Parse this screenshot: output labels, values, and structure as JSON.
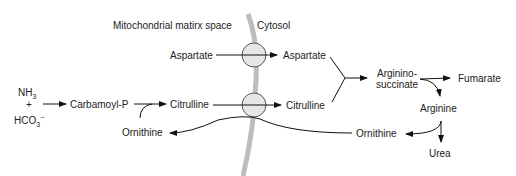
{
  "regions": {
    "matrix": "Mitochondrial matirx space",
    "cytosol": "Cytosol"
  },
  "nodes": {
    "nh3": "NH",
    "nh3_sub": "3",
    "plus": "+",
    "hco3": "HCO",
    "hco3_sub": "3",
    "hco3_sup": "−",
    "carbamoyl_p": "Carbamoyl-P",
    "citrulline_mito": "Citrulline",
    "ornithine_mito": "Ornithine",
    "aspartate_mito": "Aspartate",
    "aspartate_cyto": "Aspartate",
    "citrulline_cyto": "Citrulline",
    "argininosuccinate_1": "Arginino-",
    "argininosuccinate_2": "succinate",
    "fumarate": "Fumarate",
    "arginine": "Arginine",
    "ornithine_cyto": "Ornithine",
    "urea": "Urea"
  },
  "colors": {
    "membrane": "#bdbdbd",
    "transporter_fill": "#e6e6e6",
    "transporter_stroke": "#555555",
    "line": "#111111"
  }
}
